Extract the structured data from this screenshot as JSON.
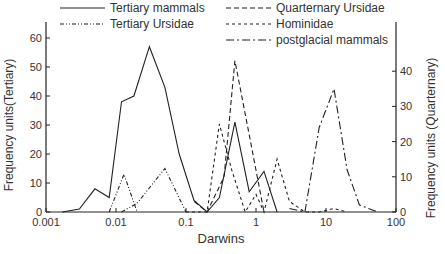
{
  "chart_data": {
    "type": "line",
    "title": "",
    "xlabel": "Darwins",
    "ylabel": "Frequency units(Tertiary)",
    "ylabel_right": "Frequency units (Quarternary)",
    "x_scale": "log",
    "xlim": [
      0.001,
      100
    ],
    "ylim": [
      0,
      65
    ],
    "ylim_right": [
      0,
      50
    ],
    "x_ticks": [
      "0.001",
      "0.01",
      "0.1",
      "1",
      "10",
      "100"
    ],
    "y_ticks": [
      "0",
      "10",
      "20",
      "30",
      "40",
      "50",
      "60"
    ],
    "y_ticks_right": [
      "0",
      "10",
      "20",
      "30",
      "40"
    ],
    "grid": false,
    "legend_position": "top",
    "series": [
      {
        "name": "Tertiary mammals",
        "axis": "left",
        "style": "solid",
        "x": [
          0.0017,
          0.003,
          0.005,
          0.008,
          0.012,
          0.018,
          0.03,
          0.05,
          0.08,
          0.13,
          0.2,
          0.3,
          0.5,
          0.8,
          1.3,
          2.0
        ],
        "values": [
          0,
          1,
          8,
          5,
          38,
          40,
          57,
          43,
          20,
          4,
          0,
          5,
          31,
          7,
          14,
          0
        ]
      },
      {
        "name": "Tertiary Ursidae",
        "axis": "left",
        "style": "dash-dot-dot",
        "x": [
          0.008,
          0.013,
          0.02
        ],
        "values": [
          0,
          13,
          0
        ],
        "x2": [
          0.012,
          0.02,
          0.05,
          0.1
        ],
        "values2": [
          0,
          3,
          15,
          0
        ]
      },
      {
        "name": "Quarternary Ursidae",
        "axis": "right",
        "style": "dashed",
        "x": [
          0.13,
          0.2,
          0.35,
          0.5,
          0.8,
          1.3
        ],
        "values": [
          3,
          0,
          10,
          43,
          22,
          0
        ]
      },
      {
        "name": "Hominidae",
        "axis": "right",
        "style": "dotted-dash",
        "x": [
          0.1,
          0.2,
          0.3,
          0.45,
          0.7,
          1.0,
          1.3,
          2.0,
          3.0,
          5.0,
          8.0,
          13.0,
          20.0
        ],
        "values": [
          0,
          0,
          25,
          12,
          0,
          5,
          0,
          15,
          3,
          0,
          0,
          1,
          0
        ]
      },
      {
        "name": "postglacial mammals",
        "axis": "right",
        "style": "dash-dot",
        "x": [
          3.0,
          5.0,
          8.0,
          13.0,
          20.0,
          30.0,
          55.0
        ],
        "values": [
          1,
          0,
          24,
          35,
          12,
          2,
          0
        ]
      }
    ]
  },
  "legend": {
    "items": [
      {
        "label": "Tertiary mammals",
        "style": "solid"
      },
      {
        "label": "Tertiary Ursidae",
        "style": "dash-dot-dot"
      },
      {
        "label": "Quarternary Ursidae",
        "style": "dashed"
      },
      {
        "label": "Hominidae",
        "style": "dotted-dash"
      },
      {
        "label": "postglacial mammals",
        "style": "dash-dot"
      }
    ]
  },
  "axes": {
    "xlabel": "Darwins",
    "ylabel_left": "Frequency units(Tertiary)",
    "ylabel_right": "Frequency units (Quarternary)"
  },
  "colors": {
    "line": "#222222",
    "text": "#333333",
    "background": "#ffffff"
  }
}
